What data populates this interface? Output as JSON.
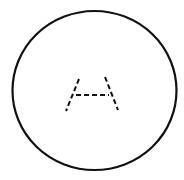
{
  "diagram": {
    "background": "#ffffff",
    "stroke_color": "#111111",
    "outer_circle": {
      "shape": "ellipse",
      "cx": 94.5,
      "cy": 90.5,
      "rx": 82,
      "ry": 79.5,
      "stroke_width": 2.2
    },
    "inner_figure": {
      "description": "dashed A-shaped trapezoid (two slanted legs joined by a crossbar)",
      "dash_pattern": "5 3",
      "stroke_width": 2,
      "left_leg": {
        "x1": 79,
        "y1": 79,
        "x2": 66,
        "y2": 111
      },
      "right_leg": {
        "x1": 105,
        "y1": 77,
        "x2": 118,
        "y2": 110
      },
      "crossbar": {
        "x1": 76,
        "y1": 95,
        "x2": 109,
        "y2": 95
      }
    }
  }
}
